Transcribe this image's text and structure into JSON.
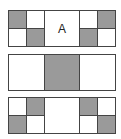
{
  "diagram": {
    "colors": {
      "fill": "#9a9a9a",
      "empty": "#ffffff",
      "border": "#444444"
    },
    "panels": [
      {
        "id": "panel-1",
        "center_label": "A",
        "left_grid": [
          [
            "gray",
            "white"
          ],
          [
            "white",
            "gray"
          ]
        ],
        "center": "white",
        "right_grid": [
          [
            "white",
            "gray"
          ],
          [
            "gray",
            "white"
          ]
        ]
      },
      {
        "id": "panel-2",
        "center_label": "",
        "left": "white",
        "center": "gray",
        "right": "white"
      },
      {
        "id": "panel-3",
        "center_label": "",
        "left_grid": [
          [
            "white",
            "gray"
          ],
          [
            "gray",
            "white"
          ]
        ],
        "center": "white",
        "right_grid": [
          [
            "gray",
            "white"
          ],
          [
            "white",
            "gray"
          ]
        ]
      }
    ]
  }
}
